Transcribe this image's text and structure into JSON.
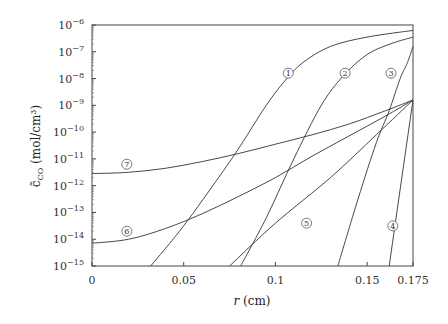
{
  "chart_data": {
    "type": "line",
    "title": "",
    "xlabel": "r (cm)",
    "ylabel": "c̃_CO (mol/cm³)",
    "xlim": [
      0,
      0.175
    ],
    "ylim": [
      1e-15,
      1e-06
    ],
    "yscale": "log",
    "grid": false,
    "legend": "inline circled numbers",
    "x_ticks": [
      {
        "value": 0,
        "label": "0"
      },
      {
        "value": 0.05,
        "label": "0.05"
      },
      {
        "value": 0.1,
        "label": "0.1"
      },
      {
        "value": 0.15,
        "label": "0.15"
      },
      {
        "value": 0.175,
        "label": "0.175"
      }
    ],
    "y_ticks": [
      {
        "exp": -6,
        "label": "10",
        "sup": "−6"
      },
      {
        "exp": -7,
        "label": "10",
        "sup": "−7"
      },
      {
        "exp": -8,
        "label": "10",
        "sup": "−8"
      },
      {
        "exp": -9,
        "label": "10",
        "sup": "−9"
      },
      {
        "exp": -10,
        "label": "10",
        "sup": "−10"
      },
      {
        "exp": -11,
        "label": "10",
        "sup": "−11"
      },
      {
        "exp": -12,
        "label": "10",
        "sup": "−12"
      },
      {
        "exp": -13,
        "label": "10",
        "sup": "−13"
      },
      {
        "exp": -14,
        "label": "10",
        "sup": "−14"
      },
      {
        "exp": -15,
        "label": "10",
        "sup": "−15"
      }
    ],
    "series": [
      {
        "name": "①",
        "label_pos": [
          0.107,
          -7.8
        ],
        "points_log10": [
          [
            0.032,
            -15
          ],
          [
            0.05,
            -13.5
          ],
          [
            0.07,
            -11.6
          ],
          [
            0.081,
            -10.5
          ],
          [
            0.095,
            -9.0
          ],
          [
            0.105,
            -8.1
          ],
          [
            0.115,
            -7.4
          ],
          [
            0.13,
            -6.8
          ],
          [
            0.15,
            -6.45
          ],
          [
            0.175,
            -6.2
          ]
        ]
      },
      {
        "name": "②",
        "label_pos": [
          0.138,
          -7.8
        ],
        "points_log10": [
          [
            0.081,
            -15
          ],
          [
            0.095,
            -13.2
          ],
          [
            0.11,
            -11.0
          ],
          [
            0.125,
            -9.0
          ],
          [
            0.137,
            -7.9
          ],
          [
            0.15,
            -7.1
          ],
          [
            0.163,
            -6.7
          ],
          [
            0.175,
            -6.45
          ]
        ]
      },
      {
        "name": "③",
        "label_pos": [
          0.163,
          -7.8
        ],
        "points_log10": [
          [
            0.134,
            -15
          ],
          [
            0.145,
            -12.5
          ],
          [
            0.155,
            -10.4
          ],
          [
            0.162,
            -9.2
          ],
          [
            0.168,
            -8.0
          ],
          [
            0.172,
            -7.4
          ],
          [
            0.175,
            -6.8
          ]
        ]
      },
      {
        "name": "④",
        "label_pos": [
          0.164,
          -13.5
        ],
        "points_log10": [
          [
            0.162,
            -15
          ],
          [
            0.175,
            -8.8
          ]
        ]
      },
      {
        "name": "⑤",
        "label_pos": [
          0.117,
          -13.4
        ],
        "points_log10": [
          [
            0.075,
            -15
          ],
          [
            0.1,
            -13.4
          ],
          [
            0.13,
            -11.7
          ],
          [
            0.155,
            -10.1
          ],
          [
            0.175,
            -8.8
          ]
        ]
      },
      {
        "name": "⑥",
        "label_pos": [
          0.019,
          -13.7
        ],
        "points_log10": [
          [
            0,
            -14.15
          ],
          [
            0.02,
            -14.0
          ],
          [
            0.04,
            -13.6
          ],
          [
            0.06,
            -13.05
          ],
          [
            0.08,
            -12.4
          ],
          [
            0.1,
            -11.7
          ],
          [
            0.12,
            -10.9
          ],
          [
            0.14,
            -10.15
          ],
          [
            0.16,
            -9.4
          ],
          [
            0.175,
            -8.8
          ]
        ]
      },
      {
        "name": "⑦",
        "label_pos": [
          0.019,
          -11.2
        ],
        "points_log10": [
          [
            0,
            -11.55
          ],
          [
            0.02,
            -11.5
          ],
          [
            0.04,
            -11.35
          ],
          [
            0.06,
            -11.1
          ],
          [
            0.08,
            -10.8
          ],
          [
            0.1,
            -10.45
          ],
          [
            0.12,
            -10.1
          ],
          [
            0.14,
            -9.7
          ],
          [
            0.16,
            -9.2
          ],
          [
            0.175,
            -8.8
          ]
        ]
      }
    ]
  }
}
